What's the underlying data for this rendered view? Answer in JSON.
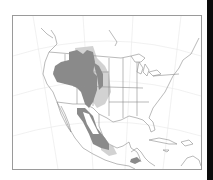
{
  "map": {
    "region": "North America",
    "projection": "conic",
    "frame": {
      "border_color": "#9a9a9a",
      "background": "#ffffff"
    },
    "linework_color": "#8c8c8c",
    "graticule_color": "#e6e6e6",
    "range": {
      "core_color": "#8a8a8a",
      "peripheral_color": "#cfcfcf",
      "description": "Species distribution range shading across western US, northwestern Mexico, and a small area in Central America"
    }
  },
  "edge": {
    "color": "#0a0a0a"
  }
}
